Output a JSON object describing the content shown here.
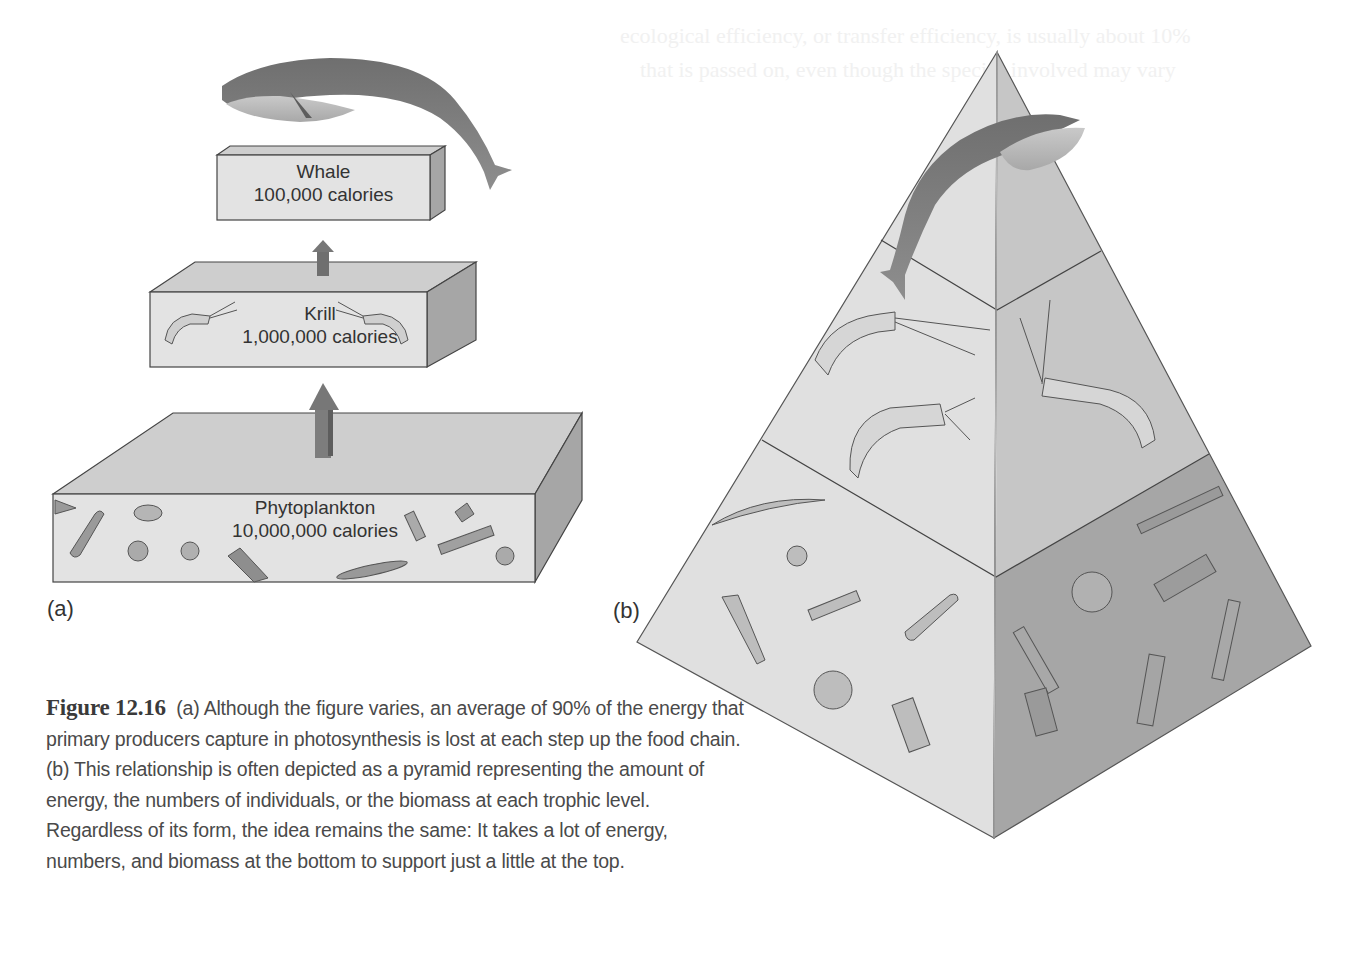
{
  "background_text": {
    "line1": "ecological efficiency, or transfer efficiency, is usually about 10%",
    "line2": "that is passed on, even though the species involved may vary"
  },
  "panel_a": {
    "letter": "(a)",
    "levels": [
      {
        "name": "Whale",
        "calories": "100,000 calories",
        "icon": "whale-icon"
      },
      {
        "name": "Krill",
        "calories": "1,000,000 calories",
        "icon": "krill-icon"
      },
      {
        "name": "Phytoplankton",
        "calories": "10,000,000 calories",
        "icon": "phytoplankton-icon"
      }
    ]
  },
  "panel_b": {
    "letter": "(b)",
    "tiers": [
      {
        "name": "Whale",
        "icon": "whale-icon"
      },
      {
        "name": "Krill",
        "icon": "krill-icon"
      },
      {
        "name": "Phytoplankton",
        "icon": "phytoplankton-icon"
      }
    ]
  },
  "caption": {
    "figure_number": "Figure 12.16",
    "text": "(a) Although the figure varies, an average of 90% of the energy that primary producers capture in photosynthesis is lost at each step up the food chain. (b) This relationship is often depicted as a pyramid representing the amount of energy, the numbers of individuals, or the biomass at each trophic level. Regardless of its form, the idea remains the same: It takes a lot of energy, numbers, and biomass at the bottom to support just a little at the top."
  },
  "colors": {
    "box_front": "#e2e2e2",
    "box_top": "#cfcfcf",
    "box_side": "#a9a9a9",
    "arrow": "#7d7d7d",
    "pyramid_left": "#e0e0e0",
    "pyramid_right_top": "#c4c4c4",
    "pyramid_right_bottom": "#a4a4a4",
    "whale": "#7b7b7b"
  }
}
